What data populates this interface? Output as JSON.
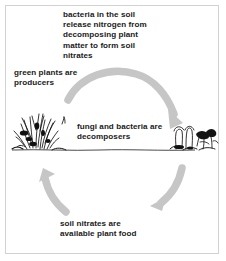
{
  "diagram": {
    "background_color": "#ffffff",
    "border_color": "#d2d2d2",
    "arrow_color": "#c6c6c6",
    "text_color": "#1a1a1a",
    "sketch_color": "#111111"
  },
  "labels": {
    "top": "bacteria in the soil\nrelease nitrogen from\ndecomposing plant\nmatter to form soil\nnitrates",
    "producers": "green plants are\nproducers",
    "decomposers": "fungi and bacteria are\ndecomposers",
    "nitrates": "soil nitrates are\navailable plant food"
  },
  "arrows": [
    {
      "name": "arrow-plants-to-decomposers",
      "from": "green plants are producers",
      "to": "fungi and bacteria are decomposers",
      "direction": "clockwise-top"
    },
    {
      "name": "arrow-decomposers-to-nitrates",
      "from": "fungi and bacteria are decomposers",
      "to": "soil nitrates are available plant food",
      "direction": "clockwise-right"
    },
    {
      "name": "arrow-nitrates-to-plants",
      "from": "soil nitrates are available plant food",
      "to": "green plants are producers",
      "direction": "clockwise-left"
    }
  ],
  "illustrations": [
    {
      "name": "grass-clump-sketch",
      "depicts": "green plants growing in soil"
    },
    {
      "name": "mushroom-cluster-sketch",
      "depicts": "fungi and leaf litter on soil"
    },
    {
      "name": "ground-line",
      "depicts": "soil surface line"
    }
  ]
}
